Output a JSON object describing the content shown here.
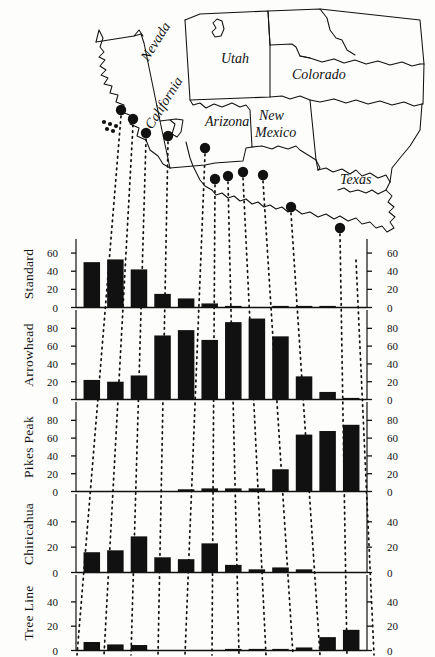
{
  "figure": {
    "bar_color": "#111111",
    "line_color": "#111111"
  },
  "map": {
    "state_labels": [
      {
        "name": "Nevada",
        "x": 148,
        "y": 62,
        "rotate": -58
      },
      {
        "name": "California",
        "x": 152,
        "y": 130,
        "rotate": -58
      },
      {
        "name": "Utah",
        "x": 221,
        "y": 63,
        "rotate": 0
      },
      {
        "name": "Colorado",
        "x": 294,
        "y": 79,
        "rotate": 0
      },
      {
        "name": "Arizona",
        "x": 209,
        "y": 126,
        "rotate": 0
      },
      {
        "name": "New",
        "x": 261,
        "y": 120,
        "rotate": 0
      },
      {
        "name": "Mexico",
        "x": 261,
        "y": 136,
        "rotate": 0
      },
      {
        "name": "Texas",
        "x": 344,
        "y": 184,
        "rotate": 0
      }
    ],
    "sites": [
      {
        "label": "site-1",
        "x": 121,
        "y": 110
      },
      {
        "label": "site-2",
        "x": 133,
        "y": 119
      },
      {
        "label": "site-3",
        "x": 146,
        "y": 133
      },
      {
        "label": "site-4",
        "x": 168,
        "y": 136
      },
      {
        "label": "site-5",
        "x": 205,
        "y": 148
      },
      {
        "label": "site-6",
        "x": 215,
        "y": 179
      },
      {
        "label": "site-7",
        "x": 228,
        "y": 176
      },
      {
        "label": "site-8",
        "x": 243,
        "y": 172
      },
      {
        "label": "site-9",
        "x": 263,
        "y": 175
      },
      {
        "label": "site-10",
        "x": 291,
        "y": 207
      },
      {
        "label": "site-11",
        "x": 340,
        "y": 228
      },
      {
        "label": "site-12",
        "x": 356,
        "y": 254
      }
    ]
  },
  "chart_data": {
    "type": "bar",
    "title": "",
    "xlabel": "",
    "ylabel": "",
    "grid": false,
    "legend": "none",
    "n_categories": 12,
    "categories": [
      "1",
      "2",
      "3",
      "4",
      "5",
      "6",
      "7",
      "8",
      "9",
      "10",
      "11",
      "12"
    ],
    "panels": [
      {
        "name": "Standard",
        "ylabel": "Standard",
        "ylim": [
          0,
          70
        ],
        "yticks": [
          0,
          20,
          40,
          60
        ],
        "ytick_labels": [
          "0",
          "20",
          "40",
          "60"
        ],
        "values": [
          50,
          53,
          42,
          15,
          10,
          4.5,
          1.5,
          0,
          1,
          0.8,
          0.8,
          0
        ]
      },
      {
        "name": "Arrowhead",
        "ylabel": "Arrowhead",
        "ylim": [
          0,
          95
        ],
        "yticks": [
          0,
          20,
          40,
          60,
          80
        ],
        "ytick_labels": [
          "0",
          "20",
          "40",
          "60",
          "80"
        ],
        "values": [
          22,
          20,
          27,
          72,
          78,
          67,
          87,
          91,
          71,
          26,
          8.5,
          1
        ]
      },
      {
        "name": "Pikes Peak",
        "ylabel": "Pikes Peak",
        "ylim": [
          0,
          95
        ],
        "yticks": [
          0,
          20,
          40,
          60,
          80
        ],
        "ytick_labels": [
          "0",
          "20",
          "40",
          "60",
          "80"
        ],
        "values": [
          0,
          0,
          0,
          0,
          2.5,
          3.5,
          3.5,
          3.5,
          25,
          64,
          68,
          75
        ]
      },
      {
        "name": "Chiricahua",
        "ylabel": "Chiricahua",
        "ylim": [
          0,
          58
        ],
        "yticks": [
          0,
          20,
          40
        ],
        "ytick_labels": [
          "0",
          "20",
          "40"
        ],
        "values": [
          16,
          17.5,
          28.5,
          12,
          10.5,
          23,
          6,
          2.5,
          4,
          2.5,
          0,
          0
        ]
      },
      {
        "name": "Tree Line",
        "ylabel": "Tree Line",
        "ylim": [
          0,
          58
        ],
        "yticks": [
          0,
          20,
          40
        ],
        "ytick_labels": [
          "0",
          "20",
          "40"
        ],
        "values": [
          7,
          5,
          4.5,
          0,
          0,
          0,
          1,
          1,
          1,
          2.5,
          11,
          17
        ]
      }
    ]
  }
}
